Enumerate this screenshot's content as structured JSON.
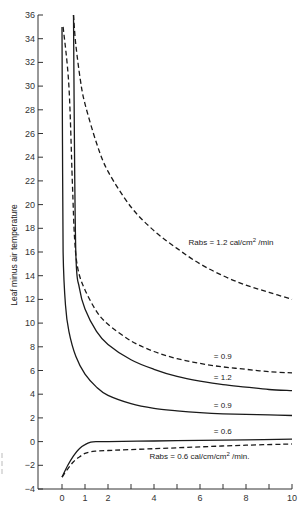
{
  "chart_data": {
    "type": "line",
    "title": "",
    "xlabel": "",
    "ylabel": "Leaf minus air temperature",
    "xlim": [
      -0.5,
      10
    ],
    "ylim": [
      -4,
      36
    ],
    "x_ticks": [
      0,
      1,
      2,
      3,
      4,
      5,
      6,
      7,
      8,
      9,
      10
    ],
    "x_tick_labels": [
      "0",
      "1",
      "2",
      "",
      "4",
      "",
      "6",
      "",
      "8",
      "",
      "10"
    ],
    "y_ticks": [
      -4,
      -2,
      0,
      2,
      4,
      6,
      8,
      10,
      12,
      14,
      16,
      18,
      20,
      22,
      24,
      26,
      28,
      30,
      32,
      34,
      36
    ],
    "y_tick_labels": [
      "-4",
      "-2",
      "0",
      "2",
      "4",
      "6",
      "8",
      "10",
      "12",
      "14",
      "16",
      "18",
      "20",
      "22",
      "24",
      "26",
      "28",
      "30",
      "32",
      "34",
      "36"
    ],
    "grid": false,
    "legend": "inline annotations",
    "series": [
      {
        "name": "Rabs = 1.2 cal/cm2/min (dashed)",
        "style": "dashed",
        "x": [
          0.5,
          0.6,
          0.8,
          1.0,
          1.5,
          2,
          3,
          4,
          5,
          6,
          7,
          8,
          9,
          10
        ],
        "y": [
          36,
          33.5,
          30.5,
          28.5,
          25.2,
          22.8,
          19.8,
          17.8,
          16.3,
          15.0,
          14.0,
          13.2,
          12.6,
          12.0
        ]
      },
      {
        "name": "= 0.9 (dashed)",
        "style": "dashed",
        "x": [
          0.05,
          0.3,
          0.45,
          0.55,
          0.7,
          1.0,
          1.5,
          2,
          3,
          4,
          5,
          6,
          7,
          8,
          9,
          10
        ],
        "y": [
          35,
          30,
          22,
          17,
          14.5,
          12.8,
          11.0,
          9.9,
          8.5,
          7.6,
          7.0,
          6.6,
          6.3,
          6.1,
          5.9,
          5.8
        ]
      },
      {
        "name": "= 1.2 (solid)",
        "style": "solid",
        "x": [
          0.5,
          0.52,
          0.6,
          0.75,
          1.0,
          1.5,
          2,
          3,
          4,
          5,
          6,
          7,
          8,
          9,
          10
        ],
        "y": [
          36,
          30,
          16,
          13.0,
          11.2,
          9.3,
          8.2,
          6.9,
          6.1,
          5.5,
          5.1,
          4.8,
          4.6,
          4.4,
          4.3
        ]
      },
      {
        "name": "= 0.9 (solid)",
        "style": "solid",
        "x": [
          0.0,
          0.02,
          0.05,
          0.15,
          0.3,
          0.6,
          1.0,
          1.5,
          2,
          3,
          4,
          5,
          6,
          7,
          8,
          9,
          10
        ],
        "y": [
          35,
          25,
          16,
          11.5,
          9.3,
          7.2,
          5.7,
          4.6,
          3.9,
          3.2,
          2.8,
          2.6,
          2.45,
          2.35,
          2.3,
          2.25,
          2.2
        ]
      },
      {
        "name": "= 0.6 (solid)",
        "style": "solid",
        "x": [
          0.0,
          0.25,
          0.5,
          0.75,
          1.0,
          1.25,
          1.5,
          2,
          4,
          6,
          8,
          10
        ],
        "y": [
          -3.0,
          -2.0,
          -1.2,
          -0.6,
          -0.25,
          -0.05,
          0.0,
          0.0,
          0.05,
          0.1,
          0.15,
          0.2
        ]
      },
      {
        "name": "Rabs = 0.6 cal/cm/cm2/min (dashed)",
        "style": "dashed",
        "x": [
          0.0,
          0.25,
          0.5,
          0.75,
          1.0,
          1.25,
          1.5,
          2,
          4,
          6,
          8,
          10
        ],
        "y": [
          -3.0,
          -2.3,
          -1.7,
          -1.3,
          -1.0,
          -0.85,
          -0.8,
          -0.75,
          -0.6,
          -0.45,
          -0.3,
          -0.2
        ]
      }
    ],
    "annotations": [
      {
        "text": "Rabs = 1.2 cal/cm",
        "sup": "2",
        "suffix": " /min",
        "x": 5.5,
        "y": 16.6
      },
      {
        "text": "= 0.9",
        "x": 6.6,
        "y": 7.0
      },
      {
        "text": "= 1.2",
        "x": 6.6,
        "y": 5.2
      },
      {
        "text": "= 0.9",
        "x": 6.6,
        "y": 2.8
      },
      {
        "text": "= 0.6",
        "x": 6.6,
        "y": 0.6
      },
      {
        "text": "Rabs = 0.6 cal/cm/cm",
        "sup": "2",
        "suffix": " /min.",
        "x": 3.8,
        "y": -1.5
      }
    ]
  }
}
